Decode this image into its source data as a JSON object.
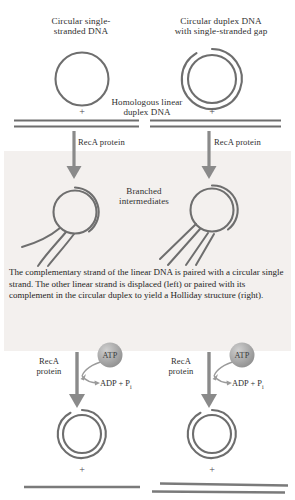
{
  "figure": {
    "title_left": "Circular single-\nstranded DNA",
    "title_right": "Circular duplex DNA\nwith single-stranded gap",
    "middle_label": "Homologous linear\nduplex DNA",
    "step1_left_label": "RecA protein",
    "step1_right_label": "RecA protein",
    "branched_label": "Branched\nintermediates",
    "caption": "The complementary strand of the linear DNA is paired with a circular single strand. The other linear strand is displaced (left) or paired with its complement in the circular duplex to yield a Holliday structure (right).",
    "plus_signs": {
      "top_left": "+",
      "top_right": "+",
      "bottom_left": "+",
      "bottom_right": "+"
    },
    "step2_left": {
      "enzyme": "RecA\nprotein",
      "cofactor": "ATP",
      "products": "ADP + P"
    },
    "step2_right": {
      "enzyme": "RecA\nprotein",
      "cofactor": "ATP",
      "products": "ADP + P"
    },
    "products_subscript": "i",
    "colors": {
      "stroke": "#6e6e6e",
      "arrow": "#808080",
      "text": "#2b2b2b",
      "panel_bg": "#f3f0ee",
      "atp_fill": "#a9a9a9",
      "background": "#ffffff"
    }
  }
}
